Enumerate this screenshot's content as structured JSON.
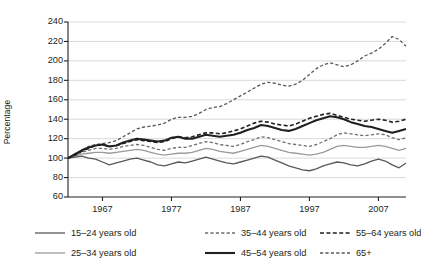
{
  "chart_data": {
    "type": "line",
    "title": "",
    "xlabel": "",
    "ylabel": "Percentage",
    "ylim": [
      60,
      240
    ],
    "xlim": [
      1962,
      2011
    ],
    "yticks": [
      60,
      80,
      100,
      120,
      140,
      160,
      180,
      200,
      220,
      240
    ],
    "xticks": [
      1967,
      1977,
      1987,
      1997,
      2007
    ],
    "grid": "horizontal",
    "legend_position": "below-axes",
    "x": [
      1962,
      1963,
      1964,
      1965,
      1966,
      1967,
      1968,
      1969,
      1970,
      1971,
      1972,
      1973,
      1974,
      1975,
      1976,
      1977,
      1978,
      1979,
      1980,
      1981,
      1982,
      1983,
      1984,
      1985,
      1986,
      1987,
      1988,
      1989,
      1990,
      1991,
      1992,
      1993,
      1994,
      1995,
      1996,
      1997,
      1998,
      1999,
      2000,
      2001,
      2002,
      2003,
      2004,
      2005,
      2006,
      2007,
      2008,
      2009,
      2010,
      2011
    ],
    "series": [
      {
        "name": "15–24 years old",
        "style": "solid",
        "color": "#58585a",
        "width": 1.3,
        "values": [
          100,
          101,
          102,
          100,
          99,
          96,
          93,
          95,
          97,
          99,
          100,
          98,
          96,
          93,
          92,
          94,
          96,
          95,
          97,
          99,
          101,
          99,
          97,
          95,
          94,
          96,
          98,
          100,
          102,
          101,
          98,
          95,
          92,
          90,
          88,
          87,
          89,
          92,
          94,
          96,
          95,
          93,
          92,
          94,
          97,
          99,
          97,
          93,
          90,
          95
        ]
      },
      {
        "name": "25–34 years old",
        "style": "solid",
        "color": "#9a9a9c",
        "width": 1.3,
        "values": [
          100,
          102,
          104,
          105,
          106,
          106,
          105,
          106,
          107,
          108,
          109,
          108,
          106,
          104,
          103,
          104,
          105,
          105,
          106,
          108,
          110,
          109,
          107,
          106,
          105,
          107,
          109,
          111,
          113,
          112,
          110,
          108,
          106,
          105,
          104,
          103,
          104,
          106,
          109,
          112,
          113,
          112,
          111,
          111,
          112,
          113,
          112,
          110,
          108,
          110
        ]
      },
      {
        "name": "35–44 years old",
        "style": "dashed",
        "color": "#6d6e70",
        "width": 1.3,
        "values": [
          100,
          103,
          106,
          108,
          110,
          110,
          109,
          110,
          112,
          113,
          114,
          113,
          111,
          109,
          108,
          110,
          111,
          111,
          113,
          115,
          117,
          116,
          114,
          113,
          112,
          114,
          117,
          119,
          122,
          121,
          119,
          117,
          115,
          114,
          113,
          112,
          114,
          117,
          120,
          124,
          126,
          125,
          124,
          123,
          124,
          125,
          124,
          121,
          119,
          121
        ]
      },
      {
        "name": "45–54 years old",
        "style": "solid",
        "color": "#231f20",
        "width": 2.1,
        "values": [
          100,
          104,
          108,
          111,
          113,
          114,
          112,
          113,
          116,
          118,
          120,
          119,
          118,
          117,
          118,
          121,
          122,
          120,
          120,
          122,
          124,
          123,
          122,
          123,
          124,
          126,
          129,
          131,
          134,
          133,
          131,
          129,
          128,
          130,
          133,
          136,
          139,
          141,
          143,
          142,
          140,
          137,
          135,
          133,
          132,
          130,
          128,
          126,
          128,
          130
        ]
      },
      {
        "name": "55–64 years old",
        "style": "dashed",
        "color": "#231f20",
        "width": 1.6,
        "values": [
          100,
          103,
          107,
          110,
          113,
          114,
          112,
          113,
          115,
          117,
          119,
          118,
          117,
          116,
          117,
          120,
          122,
          121,
          122,
          124,
          126,
          126,
          125,
          126,
          128,
          130,
          133,
          136,
          138,
          137,
          135,
          134,
          133,
          135,
          138,
          141,
          143,
          145,
          146,
          144,
          142,
          140,
          139,
          138,
          139,
          140,
          139,
          137,
          138,
          140
        ]
      },
      {
        "name": "65+",
        "style": "dashed",
        "color": "#58585a",
        "width": 1.3,
        "values": [
          100,
          104,
          108,
          112,
          114,
          115,
          116,
          118,
          122,
          126,
          130,
          132,
          133,
          134,
          136,
          140,
          142,
          142,
          143,
          146,
          150,
          152,
          153,
          156,
          160,
          164,
          168,
          172,
          176,
          178,
          177,
          175,
          174,
          176,
          180,
          186,
          192,
          196,
          198,
          196,
          194,
          196,
          200,
          205,
          208,
          212,
          218,
          225,
          222,
          215
        ]
      }
    ]
  },
  "axis": {
    "ylabel": "Percentage",
    "yticks": [
      "240",
      "220",
      "200",
      "180",
      "160",
      "140",
      "120",
      "100",
      "80",
      "60"
    ],
    "xticks": [
      "1967",
      "1977",
      "1987",
      "1997",
      "2007"
    ]
  },
  "legend": {
    "items": [
      {
        "label": "15–24 years old",
        "style": "solid",
        "color": "#58585a",
        "width": 1.3
      },
      {
        "label": "35–44 years old",
        "style": "dashed",
        "color": "#6d6e70",
        "width": 1.3
      },
      {
        "label": "55–64 years old",
        "style": "dashed",
        "color": "#231f20",
        "width": 1.6
      },
      {
        "label": "25–34 years old",
        "style": "solid",
        "color": "#9a9a9c",
        "width": 1.3
      },
      {
        "label": "45–54 years old",
        "style": "solid",
        "color": "#231f20",
        "width": 2.1
      },
      {
        "label": "65+",
        "style": "dashed",
        "color": "#58585a",
        "width": 1.3
      }
    ]
  }
}
